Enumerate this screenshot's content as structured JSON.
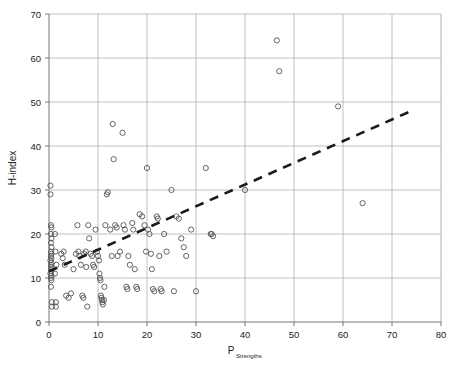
{
  "chart_data": {
    "type": "scatter",
    "title": "",
    "xlabel": "P",
    "xlabel_sub": "Strengths",
    "ylabel": "H-index",
    "xlim": [
      0,
      80
    ],
    "ylim": [
      0,
      70
    ],
    "xticks": [
      0,
      10,
      20,
      30,
      40,
      50,
      60,
      70,
      80
    ],
    "yticks": [
      0,
      10,
      20,
      30,
      40,
      50,
      60,
      70
    ],
    "xtick_labels": [
      "0",
      "10",
      "20",
      "30",
      "40",
      "50",
      "60",
      "70",
      "80"
    ],
    "ytick_labels": [
      "0",
      "10",
      "20",
      "30",
      "40",
      "50",
      "60",
      "70"
    ],
    "grid": true,
    "grid_color": "#b0b0b0",
    "legend": "none",
    "marker": "open-circle",
    "marker_color": "#555555",
    "series": [
      {
        "name": "Scholars",
        "points": [
          [
            0.3,
            31
          ],
          [
            0.3,
            29
          ],
          [
            0.4,
            22
          ],
          [
            0.5,
            21.5
          ],
          [
            0.4,
            20
          ],
          [
            0.5,
            19
          ],
          [
            0.4,
            18
          ],
          [
            0.5,
            17
          ],
          [
            0.4,
            16
          ],
          [
            0.5,
            15.5
          ],
          [
            0.4,
            15
          ],
          [
            0.5,
            14.5
          ],
          [
            0.3,
            14
          ],
          [
            0.5,
            13.5
          ],
          [
            0.4,
            13
          ],
          [
            0.5,
            12.5
          ],
          [
            0.4,
            12
          ],
          [
            0.5,
            11.5
          ],
          [
            0.3,
            11
          ],
          [
            0.5,
            10.5
          ],
          [
            0.4,
            10
          ],
          [
            0.5,
            9.5
          ],
          [
            0.4,
            8
          ],
          [
            0.6,
            4.5
          ],
          [
            0.6,
            3.5
          ],
          [
            1.2,
            20
          ],
          [
            1.3,
            16
          ],
          [
            1.5,
            13
          ],
          [
            1.2,
            11
          ],
          [
            1.4,
            4.5
          ],
          [
            1.4,
            3.5
          ],
          [
            2.5,
            15.5
          ],
          [
            2.8,
            14.5
          ],
          [
            3.0,
            16
          ],
          [
            3.2,
            13
          ],
          [
            3.5,
            6
          ],
          [
            4.0,
            5.5
          ],
          [
            4.5,
            6.5
          ],
          [
            5.0,
            12
          ],
          [
            5.5,
            15.5
          ],
          [
            5.8,
            22
          ],
          [
            6.0,
            16
          ],
          [
            6.2,
            15
          ],
          [
            6.5,
            13
          ],
          [
            6.8,
            6
          ],
          [
            7.0,
            5.5
          ],
          [
            7.2,
            15.5
          ],
          [
            7.5,
            16
          ],
          [
            7.6,
            12.5
          ],
          [
            7.8,
            3.5
          ],
          [
            8.0,
            22
          ],
          [
            8.2,
            19
          ],
          [
            8.5,
            15.5
          ],
          [
            8.8,
            15
          ],
          [
            9.0,
            13
          ],
          [
            9.2,
            12.5
          ],
          [
            9.5,
            21
          ],
          [
            9.8,
            16
          ],
          [
            10.0,
            15
          ],
          [
            10.2,
            14
          ],
          [
            10.3,
            11
          ],
          [
            10.4,
            10
          ],
          [
            10.5,
            9.5
          ],
          [
            10.6,
            6
          ],
          [
            10.7,
            5.5
          ],
          [
            10.8,
            5
          ],
          [
            10.9,
            4.5
          ],
          [
            11.0,
            4
          ],
          [
            11.2,
            5
          ],
          [
            11.3,
            8
          ],
          [
            11.5,
            22
          ],
          [
            11.8,
            29
          ],
          [
            12.0,
            29.5
          ],
          [
            12.5,
            21
          ],
          [
            12.8,
            15
          ],
          [
            13.0,
            45
          ],
          [
            13.2,
            37
          ],
          [
            13.5,
            22
          ],
          [
            13.8,
            21.5
          ],
          [
            14.0,
            15
          ],
          [
            14.5,
            16
          ],
          [
            15.0,
            43
          ],
          [
            15.2,
            22
          ],
          [
            15.5,
            21
          ],
          [
            15.8,
            8
          ],
          [
            16.0,
            7.5
          ],
          [
            16.2,
            15
          ],
          [
            16.5,
            13
          ],
          [
            17.0,
            22.5
          ],
          [
            17.2,
            21
          ],
          [
            17.5,
            12
          ],
          [
            17.8,
            8
          ],
          [
            18.0,
            7.5
          ],
          [
            18.5,
            24.5
          ],
          [
            19.0,
            24
          ],
          [
            19.5,
            22
          ],
          [
            19.8,
            16
          ],
          [
            20.0,
            35
          ],
          [
            20.2,
            21
          ],
          [
            20.5,
            20
          ],
          [
            20.8,
            15.5
          ],
          [
            21.0,
            12
          ],
          [
            21.2,
            7.5
          ],
          [
            21.5,
            7
          ],
          [
            22.0,
            24
          ],
          [
            22.2,
            23.5
          ],
          [
            22.5,
            15
          ],
          [
            22.8,
            7.5
          ],
          [
            23.0,
            7
          ],
          [
            23.5,
            20
          ],
          [
            24.0,
            16
          ],
          [
            25.0,
            30
          ],
          [
            25.5,
            7
          ],
          [
            26.0,
            24
          ],
          [
            26.5,
            23.5
          ],
          [
            27.0,
            19
          ],
          [
            27.5,
            17
          ],
          [
            28.0,
            15
          ],
          [
            29.0,
            21
          ],
          [
            30.0,
            7
          ],
          [
            32.0,
            35
          ],
          [
            33.0,
            20
          ],
          [
            33.2,
            20
          ],
          [
            33.5,
            19.5
          ],
          [
            40.0,
            30
          ],
          [
            46.5,
            64
          ],
          [
            47.0,
            57
          ],
          [
            59.0,
            49
          ],
          [
            64.0,
            27
          ]
        ]
      }
    ],
    "trendline": {
      "x0": 0,
      "y0": 11.5,
      "x1": 74,
      "y1": 48,
      "style": "dashed",
      "color": "#1a1a1a"
    }
  }
}
